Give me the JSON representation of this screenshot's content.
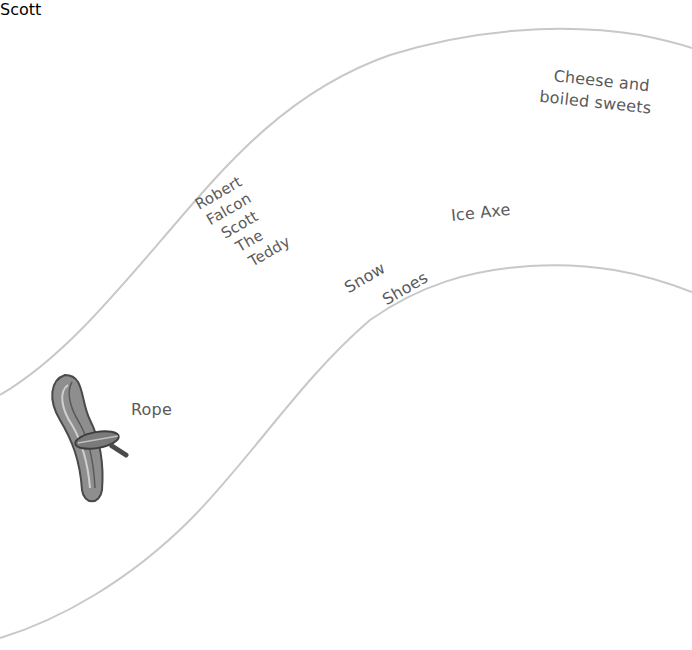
{
  "illustration": {
    "style": "grayscale pencil illustration on white",
    "colors": {
      "background": "#ffffff",
      "path_line": "#c8c8c8",
      "label_text": "#5a5a5a",
      "dark_ink": "#3c3c3c",
      "mid_gray": "#8a8a8a",
      "light_gray": "#d4d4d4"
    }
  },
  "items": {
    "rope": {
      "label": "Rope"
    },
    "teddy": {
      "label_lines": [
        "Robert",
        "Falcon",
        "Scott",
        "The",
        "Teddy"
      ],
      "sweater_text": "Scott"
    },
    "snow_shoes": {
      "label_lines": [
        "Snow",
        "Shoes"
      ]
    },
    "ice_axe": {
      "label": "Ice Axe"
    },
    "cheese_sweets": {
      "label_lines": [
        "Cheese and",
        "boiled sweets"
      ]
    }
  },
  "bird": {
    "subject": "bird"
  }
}
